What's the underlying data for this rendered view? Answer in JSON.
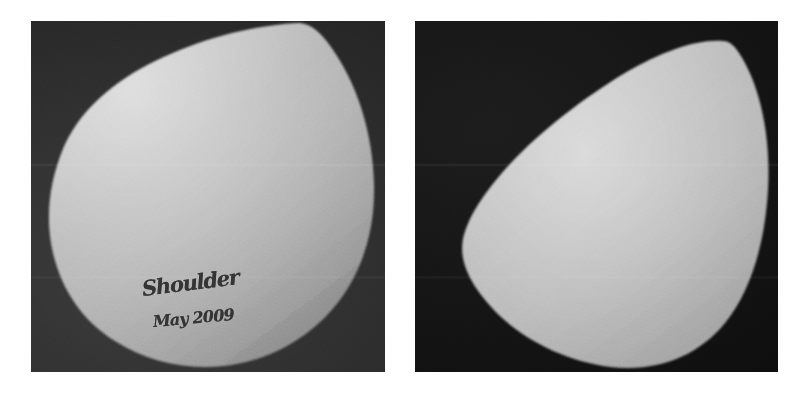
{
  "figure": {
    "background_color": "#ffffff",
    "width": 805,
    "height": 395
  },
  "panels": [
    {
      "id": "left",
      "name": "left-photograph",
      "caption": "",
      "background_color": "#323232",
      "specimen_color": "#b9b9b9",
      "specimen_highlight_color": "#d2d2d2",
      "specimen_shadow_color": "#8e8e8e",
      "view": "broad rounded face of shoulder specimen",
      "bounds": {
        "x": 31,
        "y": 21,
        "width": 354,
        "height": 351
      },
      "annotation": {
        "present": true,
        "label": "Shoulder",
        "date": "May 2009",
        "ink_color": "#2b2b2b"
      }
    },
    {
      "id": "right",
      "name": "right-photograph",
      "caption": "",
      "background_color": "#151515",
      "specimen_color": "#bcbcbc",
      "specimen_highlight_color": "#d6d6d6",
      "specimen_shadow_color": "#909090",
      "view": "tapered teardrop profile of shoulder specimen",
      "bounds": {
        "x": 415,
        "y": 21,
        "width": 363,
        "height": 351
      },
      "annotation": {
        "present": false,
        "label": "",
        "date": "",
        "ink_color": ""
      }
    }
  ]
}
